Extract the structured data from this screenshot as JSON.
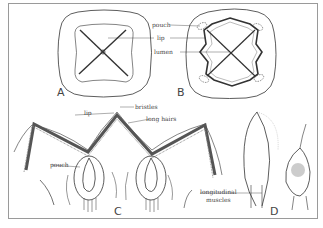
{
  "figure": {
    "panels": [
      {
        "id": "A",
        "label": "A"
      },
      {
        "id": "B",
        "label": "B"
      },
      {
        "id": "C",
        "label": "C"
      },
      {
        "id": "D",
        "label": "D"
      }
    ],
    "labels": {
      "B": {
        "pouch": "pouch",
        "lip": "lip",
        "lumen": "lumen"
      },
      "C": {
        "lip": "lip",
        "bristles": "bristles",
        "long_hairs": "long hairs",
        "pouch": "pouch"
      },
      "D": {
        "longitudinal_muscles_line1": "longitudinal",
        "longitudinal_muscles_line2": "muscles"
      }
    },
    "colors": {
      "line": "#333333",
      "border": "#9a9a9a",
      "label": "#444444",
      "background": "#ffffff"
    }
  }
}
